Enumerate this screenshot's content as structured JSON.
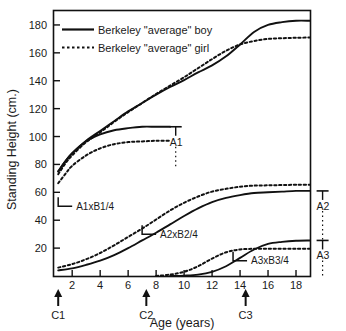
{
  "chart_data": {
    "type": "line",
    "title": "",
    "xlabel": "Age (years)",
    "ylabel": "Standing Height (cm.)",
    "xlim": [
      0.7,
      19.0
    ],
    "ylim": [
      0,
      190
    ],
    "xticks": [
      2,
      4,
      6,
      8,
      10,
      12,
      14,
      16,
      18
    ],
    "yticks": [
      20,
      40,
      60,
      80,
      100,
      120,
      140,
      160,
      180
    ],
    "grid": false,
    "legend_position": "top-left",
    "legend": [
      {
        "name": "Berkeley \"average\" boy",
        "style": "solid"
      },
      {
        "name": "Berkeley \"average\" girl",
        "style": "dotted"
      }
    ],
    "series": [
      {
        "name": "Berkeley \"average\" boy total height",
        "style": "solid",
        "x": [
          1.0,
          1.5,
          2.0,
          3.0,
          4.0,
          5.0,
          6.0,
          7.0,
          8.0,
          9.0,
          10.0,
          11.0,
          12.0,
          13.0,
          14.0,
          15.0,
          16.0,
          17.0,
          18.0,
          19.0
        ],
        "y": [
          75.0,
          82.0,
          88.0,
          97.0,
          104.0,
          111.0,
          118.0,
          124.0,
          130.0,
          135.5,
          140.5,
          146.0,
          151.0,
          157.5,
          166.0,
          175.0,
          180.0,
          182.0,
          183.0,
          183.0
        ]
      },
      {
        "name": "Berkeley \"average\" girl total height",
        "style": "dotted",
        "x": [
          1.0,
          1.5,
          2.0,
          3.0,
          4.0,
          5.0,
          6.0,
          7.0,
          8.0,
          9.0,
          10.0,
          11.0,
          12.0,
          13.0,
          14.0,
          15.0,
          16.0,
          17.0,
          18.0,
          19.0
        ],
        "y": [
          73.0,
          80.5,
          86.5,
          96.0,
          103.0,
          110.5,
          117.5,
          124.0,
          130.5,
          136.5,
          142.5,
          149.0,
          155.5,
          161.5,
          166.0,
          168.5,
          170.0,
          170.5,
          170.8,
          171.0
        ]
      },
      {
        "name": "A1xB1/4 boy component",
        "style": "solid",
        "x": [
          1.0,
          1.5,
          2.0,
          3.0,
          4.0,
          5.0,
          6.0,
          7.0,
          8.0,
          9.0
        ],
        "y": [
          75.0,
          82.0,
          88.0,
          96.5,
          101.5,
          104.5,
          106.0,
          107.0,
          107.0,
          107.0
        ]
      },
      {
        "name": "A1xB1/4 girl component",
        "style": "dotted",
        "x": [
          1.0,
          1.5,
          2.0,
          3.0,
          4.0,
          5.0,
          6.0,
          7.0,
          8.0,
          9.0
        ],
        "y": [
          66.5,
          73.0,
          79.0,
          86.5,
          91.5,
          94.5,
          96.0,
          96.5,
          97.0,
          97.0
        ]
      },
      {
        "name": "A2xB2/4 boy component",
        "style": "solid",
        "x": [
          1.0,
          2.0,
          3.0,
          4.0,
          5.0,
          6.0,
          7.0,
          8.0,
          9.0,
          10.0,
          11.0,
          12.0,
          13.0,
          14.0,
          15.0,
          16.0,
          17.0,
          18.0,
          19.0
        ],
        "y": [
          4.0,
          5.5,
          8.0,
          11.0,
          15.0,
          20.0,
          25.5,
          31.0,
          37.0,
          43.0,
          48.5,
          53.0,
          56.0,
          58.0,
          59.5,
          60.0,
          60.5,
          61.0,
          61.0
        ]
      },
      {
        "name": "A2xB2/4 girl component",
        "style": "dotted",
        "x": [
          1.0,
          2.0,
          3.0,
          4.0,
          5.0,
          6.0,
          7.0,
          8.0,
          9.0,
          10.0,
          11.0,
          12.0,
          13.0,
          14.0,
          15.0,
          16.0,
          17.0,
          18.0,
          19.0
        ],
        "y": [
          6.0,
          8.5,
          12.0,
          16.5,
          22.0,
          28.0,
          34.0,
          40.5,
          47.0,
          52.5,
          57.0,
          60.5,
          62.5,
          64.0,
          64.8,
          65.0,
          65.2,
          65.4,
          65.5
        ]
      },
      {
        "name": "A3xB3/4 boy component",
        "style": "solid",
        "x": [
          9.0,
          10.0,
          11.0,
          12.0,
          13.0,
          14.0,
          15.0,
          16.0,
          17.0,
          18.0,
          19.0
        ],
        "y": [
          0.0,
          0.3,
          1.0,
          3.0,
          7.0,
          13.0,
          19.0,
          23.0,
          24.5,
          25.3,
          25.5
        ]
      },
      {
        "name": "A3xB3/4 girl component",
        "style": "dotted",
        "x": [
          8.0,
          9.0,
          10.0,
          11.0,
          12.0,
          13.0,
          14.0,
          15.0,
          16.0,
          17.0,
          18.0,
          19.0
        ],
        "y": [
          0.0,
          1.0,
          3.0,
          7.0,
          12.5,
          17.0,
          19.0,
          19.5,
          19.5,
          19.5,
          19.5,
          19.5
        ]
      }
    ],
    "annotations": [
      {
        "label": "A1",
        "type": "range-marker",
        "x": 9.4,
        "y_top": 107.0,
        "y_bottom": 78.0
      },
      {
        "label": "A2",
        "type": "range-marker",
        "x": 19.9,
        "y_top": 61.0,
        "y_bottom": 26.0
      },
      {
        "label": "A3",
        "type": "range-marker",
        "x": 19.9,
        "y_top": 25.5,
        "y_bottom": 0.0
      },
      {
        "label": "A1xB1/4",
        "type": "slope-marker",
        "x": 2.0,
        "y": 50.0
      },
      {
        "label": "A2xB2/4",
        "type": "slope-marker",
        "x": 8.0,
        "y": 30.0
      },
      {
        "label": "A3xB3/4",
        "type": "slope-marker",
        "x": 14.5,
        "y": 11.0
      }
    ],
    "axis_markers": [
      {
        "label": "C1",
        "x": 1.0
      },
      {
        "label": "C2",
        "x": 7.3
      },
      {
        "label": "C3",
        "x": 14.4
      }
    ]
  },
  "colors": {
    "line": "#111111",
    "axis": "#111111",
    "text": "#1a1a1a",
    "background": "#ffffff"
  }
}
